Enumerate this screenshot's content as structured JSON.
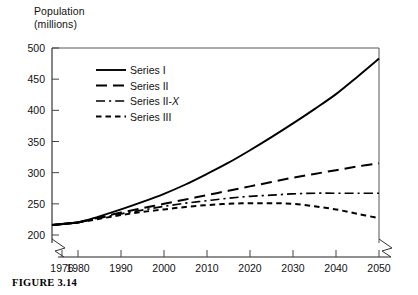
{
  "axis_title": "Population\n(millions)",
  "caption": "FIGURE 3.14",
  "chart_data": {
    "type": "line",
    "title": "",
    "subtitle": "",
    "xlabel": "",
    "ylabel": "Population (millions)",
    "xlim": [
      1976,
      2050
    ],
    "ylim": [
      200,
      500
    ],
    "yticks": [
      200,
      250,
      300,
      350,
      400,
      450,
      500
    ],
    "xticks": [
      1976,
      1980,
      1990,
      2000,
      2010,
      2020,
      2030,
      2040,
      2050
    ],
    "xtick_labels": [
      "1976",
      "1980",
      "1990",
      "2000",
      "2010",
      "2020",
      "2030",
      "2040",
      "2050"
    ],
    "ytick_labels": [
      "200",
      "250",
      "300",
      "350",
      "400",
      "450",
      "500"
    ],
    "axis_break_x": true,
    "axis_break_y": true,
    "grid": false,
    "legend_position": "upper-left-inside",
    "x": [
      1976,
      1980,
      1985,
      1990,
      1995,
      2000,
      2005,
      2010,
      2015,
      2020,
      2025,
      2030,
      2035,
      2040,
      2045,
      2050
    ],
    "series": [
      {
        "name": "Series I",
        "dash": "solid",
        "color": "#000000",
        "width": 1.9,
        "values": [
          216,
          220,
          230,
          241,
          253,
          266,
          281,
          298,
          316,
          336,
          357,
          379,
          402,
          426,
          454,
          483
        ]
      },
      {
        "name": "Series II",
        "dash": "long-dash",
        "color": "#000000",
        "width": 2.0,
        "values": [
          216,
          220,
          228,
          236,
          243,
          250,
          257,
          264,
          271,
          278,
          285,
          292,
          298,
          304,
          310,
          315
        ]
      },
      {
        "name": "Series II-X",
        "dash": "dash-dot",
        "color": "#000000",
        "width": 1.7,
        "values": [
          216,
          220,
          227,
          234,
          240,
          246,
          251,
          255,
          259,
          262,
          264,
          266,
          267,
          267,
          267,
          267
        ]
      },
      {
        "name": "Series III",
        "dash": "short-dash",
        "color": "#000000",
        "width": 2.0,
        "values": [
          216,
          220,
          226,
          232,
          237,
          241,
          245,
          248,
          250,
          251,
          251,
          250,
          246,
          241,
          234,
          227
        ]
      }
    ]
  },
  "legend": {
    "entries": [
      {
        "label": "Series I",
        "italic_tail": ""
      },
      {
        "label": "Series II",
        "italic_tail": ""
      },
      {
        "label": "Series II-",
        "italic_tail": "X"
      },
      {
        "label": "Series III",
        "italic_tail": ""
      }
    ]
  }
}
